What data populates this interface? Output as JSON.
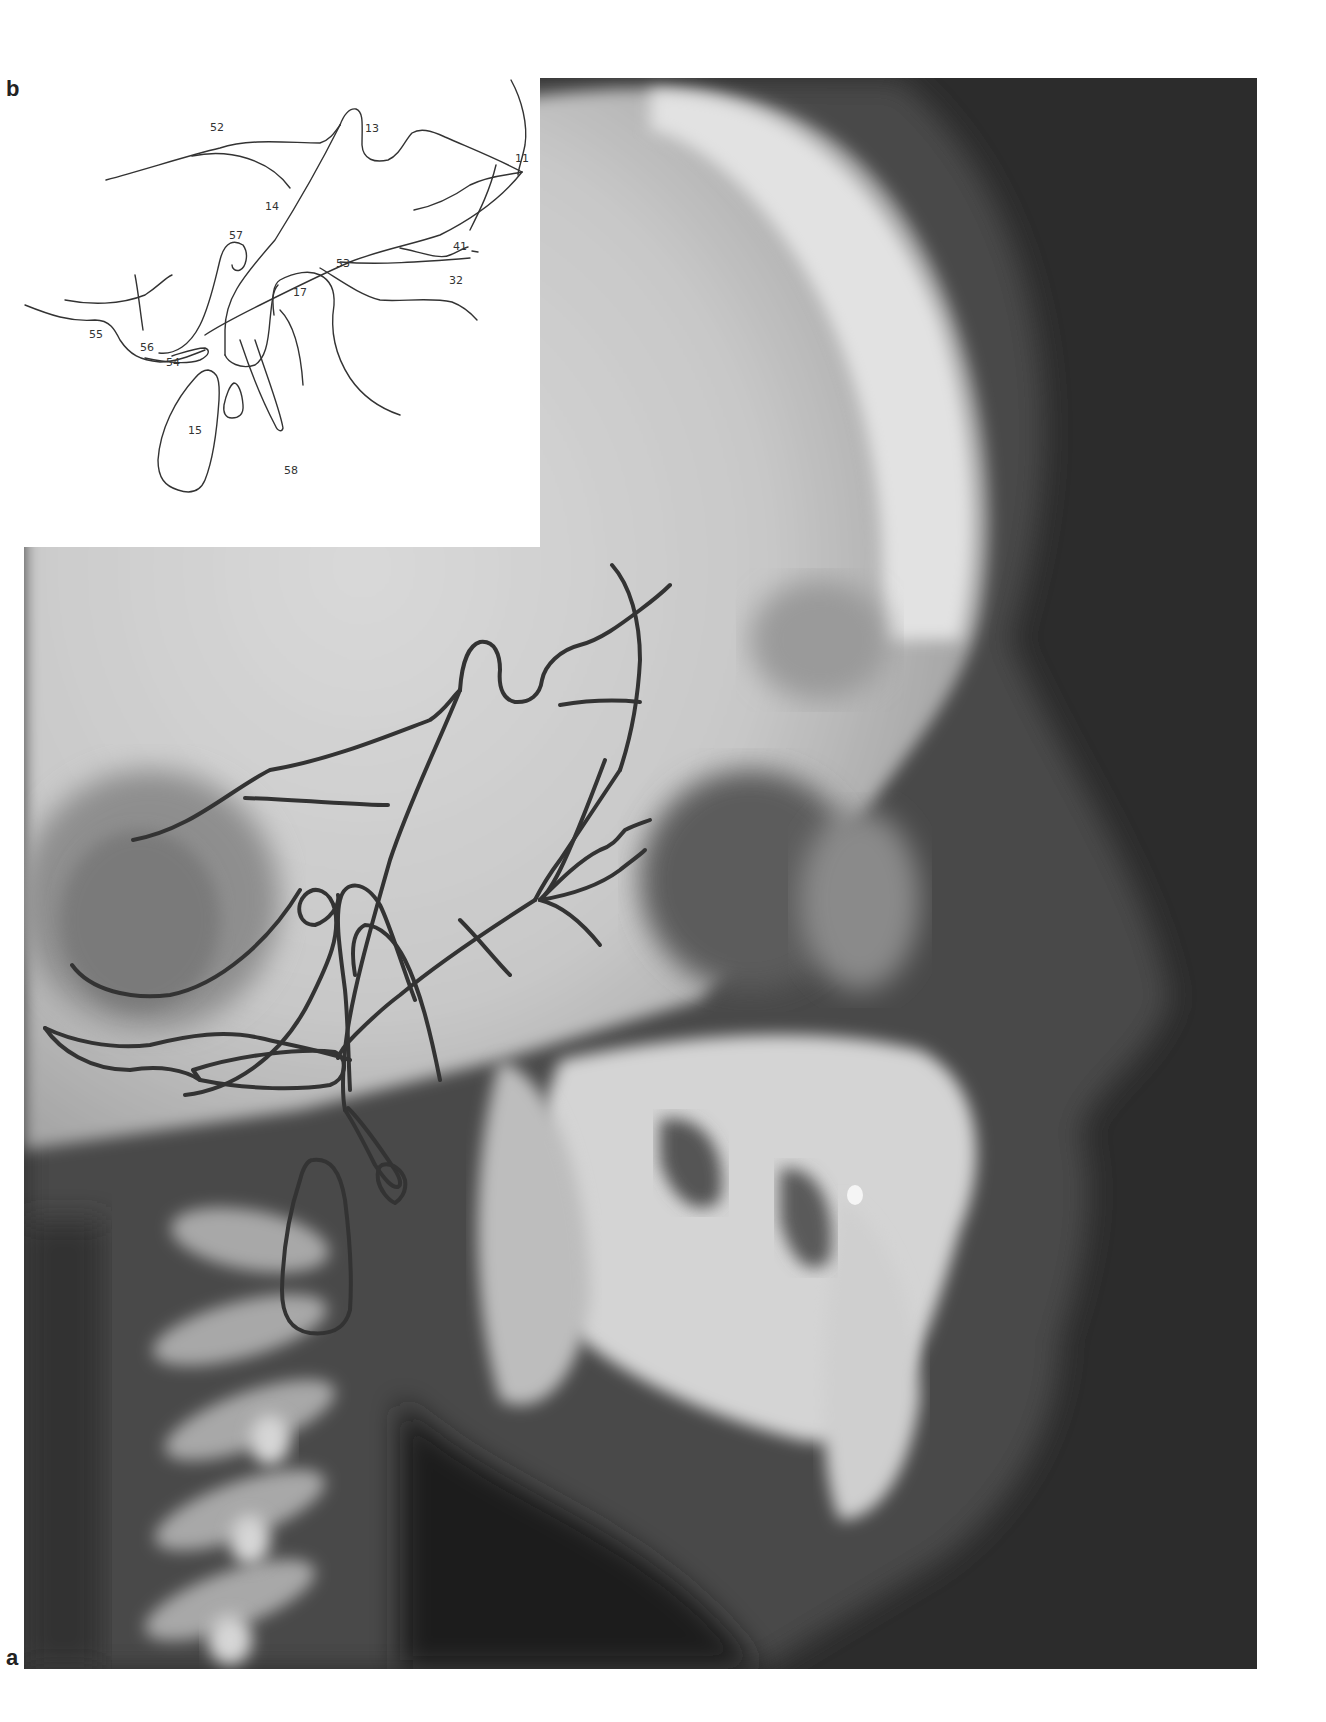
{
  "figure": {
    "panel_a_label": "a",
    "panel_b_label": "b"
  },
  "inset": {
    "landmarks": [
      {
        "id": "11",
        "label": "11"
      },
      {
        "id": "13",
        "label": "13"
      },
      {
        "id": "14",
        "label": "14"
      },
      {
        "id": "15",
        "label": "15"
      },
      {
        "id": "17",
        "label": "17"
      },
      {
        "id": "32",
        "label": "32"
      },
      {
        "id": "41",
        "label": "41"
      },
      {
        "id": "52",
        "label": "52"
      },
      {
        "id": "53",
        "label": "53"
      },
      {
        "id": "54",
        "label": "54"
      },
      {
        "id": "55",
        "label": "55"
      },
      {
        "id": "56",
        "label": "56"
      },
      {
        "id": "57",
        "label": "57"
      },
      {
        "id": "58",
        "label": "58"
      }
    ]
  },
  "colors": {
    "tracing_line": "#333333",
    "xray_dark": "#2a2a2a",
    "xray_bone": "#d8d8d8",
    "page_bg": "#ffffff"
  }
}
